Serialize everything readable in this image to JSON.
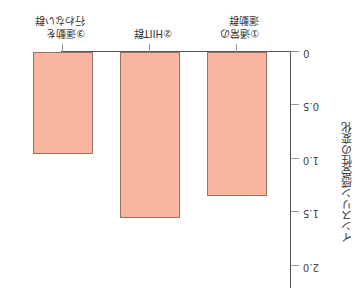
{
  "chart_data": {
    "type": "bar",
    "orientation": "rotated-180",
    "title": "",
    "xlabel": "",
    "ylabel": "インスリン感受性の変化",
    "categories": [
      "①通常の運動群",
      "②HIIT群",
      "③運動を行わない群"
    ],
    "category_lines": [
      [
        "①通常の",
        "運動群"
      ],
      [
        "②HIIT群"
      ],
      [
        "③運動を",
        "行わない群"
      ]
    ],
    "values": [
      1.35,
      1.55,
      0.95
    ],
    "ylim": [
      0,
      2.0
    ],
    "yticks": [
      "0",
      "0.5",
      "1.0",
      "1.5",
      "2.0"
    ],
    "grid": false,
    "bar_color": "#f7b49e",
    "bar_border": "#9a7060"
  }
}
